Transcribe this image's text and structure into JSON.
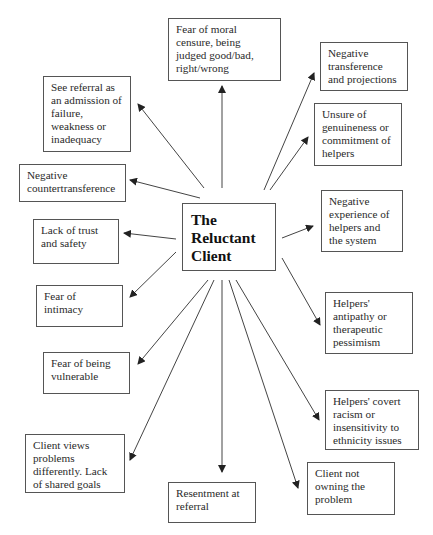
{
  "diagram": {
    "title": "The Reluctant Client",
    "center": {
      "label": "The\nReluctant\nClient"
    },
    "nodes": [
      {
        "id": "moral-censure",
        "label": "Fear of moral\ncensure, being\njudged good/bad,\nright/wrong"
      },
      {
        "id": "admission-of-failure",
        "label": "See referral as\nan admission of\nfailure,\nweakness or\ninadequacy"
      },
      {
        "id": "negative-countertransference",
        "label": "Negative\ncountertransference"
      },
      {
        "id": "lack-of-trust",
        "label": "Lack of trust\nand safety"
      },
      {
        "id": "fear-of-intimacy",
        "label": "Fear of\nintimacy"
      },
      {
        "id": "fear-of-vulnerable",
        "label": "Fear of being\nvulnerable"
      },
      {
        "id": "views-differently",
        "label": "Client views\nproblems\ndifferently. Lack\nof shared goals"
      },
      {
        "id": "resentment",
        "label": "Resentment at\nreferral"
      },
      {
        "id": "not-owning",
        "label": "Client not\nowning the\nproblem"
      },
      {
        "id": "covert-racism",
        "label": "Helpers' covert\nracism or\ninsensitivity  to\nethnicity issues"
      },
      {
        "id": "antipathy",
        "label": "Helpers'\nantipathy or\ntherapeutic\npessimism"
      },
      {
        "id": "negative-experience",
        "label": "Negative\nexperience of\nhelpers and\nthe system"
      },
      {
        "id": "unsure-genuineness",
        "label": "Unsure of\ngenuineness or\ncommitment of\nhelpers"
      },
      {
        "id": "negative-transference",
        "label": "Negative\ntransference\nand projections"
      }
    ],
    "edges_from_center_to": [
      "moral-censure",
      "admission-of-failure",
      "negative-countertransference",
      "lack-of-trust",
      "fear-of-intimacy",
      "fear-of-vulnerable",
      "views-differently",
      "resentment",
      "not-owning",
      "covert-racism",
      "antipathy",
      "negative-experience",
      "unsure-genuineness",
      "negative-transference"
    ],
    "colors": {
      "line": "#333333",
      "border": "#555555",
      "text": "#2a2a2a"
    }
  }
}
